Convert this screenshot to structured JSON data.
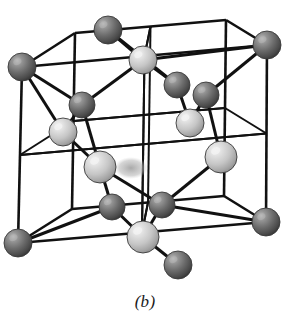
{
  "figure": {
    "caption": "(b)",
    "width": 290,
    "height": 331,
    "background_color": "#ffffff"
  },
  "style": {
    "bond_color": "#111111",
    "bond_width": 3.0,
    "edge_color": "#111111",
    "edge_width": 2.6,
    "inner_edge_width": 2.0,
    "dark_atom_color": "#6b6b6b",
    "dark_atom_shade": "#2e2e2e",
    "dark_atom_highlight": "#b4b4b4",
    "light_atom_color": "#c9c9c9",
    "light_atom_shade": "#8a8a8a",
    "light_atom_highlight": "#f2f2f2",
    "atom_outline": "#3a3a3a",
    "shadow_color": "#9a9a9a"
  },
  "chart_data": {
    "type": "scatter",
    "xlabel": "",
    "ylabel": "",
    "projection": "oblique-cabinet",
    "cube": {
      "vertices": {
        "front_bottom_left": [
          18,
          243
        ],
        "front_bottom_right": [
          266,
          222
        ],
        "front_top_left": [
          22,
          67
        ],
        "front_top_right": [
          267,
          45
        ],
        "back_bottom_left": [
          72,
          209
        ],
        "back_bottom_right": [
          224,
          196
        ],
        "back_top_left": [
          75,
          33
        ],
        "back_top_right": [
          226,
          20
        ]
      },
      "front_face": [
        "front_bottom_left",
        "front_bottom_right",
        "front_top_right",
        "front_top_left"
      ],
      "back_face": [
        "back_bottom_left",
        "back_bottom_right",
        "back_top_right",
        "back_top_left"
      ],
      "connectors": [
        [
          "front_bottom_left",
          "back_bottom_left"
        ],
        [
          "front_bottom_right",
          "back_bottom_right"
        ],
        [
          "front_top_left",
          "back_top_left"
        ],
        [
          "front_top_right",
          "back_top_right"
        ]
      ],
      "octant_subdivision": true,
      "subdivision_count": 2
    },
    "atoms": [
      {
        "id": "c1",
        "label": "corner-back-top-left",
        "cx": 108,
        "cy": 30,
        "r": 14,
        "type": "dark",
        "site": "corner"
      },
      {
        "id": "c2",
        "label": "corner-back-top-right",
        "cx": 267,
        "cy": 45,
        "r": 14,
        "type": "dark",
        "site": "corner"
      },
      {
        "id": "c3",
        "label": "corner-front-top-left",
        "cx": 22,
        "cy": 67,
        "r": 14,
        "type": "dark",
        "site": "corner"
      },
      {
        "id": "c4",
        "label": "corner-front-bottom-left",
        "cx": 18,
        "cy": 243,
        "r": 14,
        "type": "dark",
        "site": "corner"
      },
      {
        "id": "c5",
        "label": "corner-front-bottom-right",
        "cx": 266,
        "cy": 222,
        "r": 14,
        "type": "dark",
        "site": "corner"
      },
      {
        "id": "c6",
        "label": "corner-front-bottom-mid",
        "cx": 178,
        "cy": 265,
        "r": 14,
        "type": "dark",
        "site": "corner"
      },
      {
        "id": "f1",
        "label": "face-center-top",
        "cx": 143,
        "cy": 60,
        "r": 14,
        "type": "light",
        "site": "face-center"
      },
      {
        "id": "f2",
        "label": "face-center-left",
        "cx": 63,
        "cy": 132,
        "r": 14,
        "type": "light",
        "site": "face-center"
      },
      {
        "id": "f3",
        "label": "face-center-front",
        "cx": 100,
        "cy": 167,
        "r": 16,
        "type": "light",
        "site": "face-center"
      },
      {
        "id": "f4",
        "label": "face-center-back",
        "cx": 190,
        "cy": 123,
        "r": 14,
        "type": "light",
        "site": "face-center"
      },
      {
        "id": "f5",
        "label": "face-center-right",
        "cx": 221,
        "cy": 157,
        "r": 16,
        "type": "light",
        "site": "face-center"
      },
      {
        "id": "f6",
        "label": "face-center-bottom",
        "cx": 143,
        "cy": 237,
        "r": 16,
        "type": "light",
        "site": "face-center"
      },
      {
        "id": "t1",
        "label": "tetrahedral-upper-left",
        "cx": 82,
        "cy": 105,
        "r": 13,
        "type": "dark",
        "site": "tetrahedral"
      },
      {
        "id": "t2",
        "label": "tetrahedral-upper-mid",
        "cx": 177,
        "cy": 85,
        "r": 13,
        "type": "dark",
        "site": "tetrahedral"
      },
      {
        "id": "t3",
        "label": "tetrahedral-upper-right",
        "cx": 206,
        "cy": 95,
        "r": 13,
        "type": "dark",
        "site": "tetrahedral"
      },
      {
        "id": "t4",
        "label": "tetrahedral-lower-left",
        "cx": 112,
        "cy": 207,
        "r": 13,
        "type": "dark",
        "site": "tetrahedral"
      },
      {
        "id": "t5",
        "label": "tetrahedral-lower-right",
        "cx": 162,
        "cy": 205,
        "r": 13,
        "type": "dark",
        "site": "tetrahedral"
      }
    ],
    "bonds": [
      [
        "c3",
        "t1"
      ],
      [
        "f2",
        "t1"
      ],
      [
        "f3",
        "t1"
      ],
      [
        "f1",
        "t1"
      ],
      [
        "f1",
        "t2"
      ],
      [
        "f4",
        "t2"
      ],
      [
        "t2",
        "c1"
      ],
      [
        "f4",
        "t3"
      ],
      [
        "f5",
        "t3"
      ],
      [
        "c2",
        "t3"
      ],
      [
        "f3",
        "t4"
      ],
      [
        "f6",
        "t4"
      ],
      [
        "t4",
        "c4"
      ],
      [
        "f5",
        "t5"
      ],
      [
        "f6",
        "t5"
      ],
      [
        "t5",
        "c5"
      ],
      [
        "f6",
        "c6"
      ],
      [
        "f3",
        "t5"
      ],
      [
        "f2",
        "c3"
      ],
      [
        "f1",
        "c1"
      ],
      [
        "f1",
        "c2"
      ],
      [
        "f3",
        "f2"
      ]
    ],
    "legend": [
      {
        "name": "dark atom (corner / tetrahedral site)",
        "color": "#6b6b6b"
      },
      {
        "name": "light atom (face-centered site)",
        "color": "#c9c9c9"
      }
    ]
  }
}
